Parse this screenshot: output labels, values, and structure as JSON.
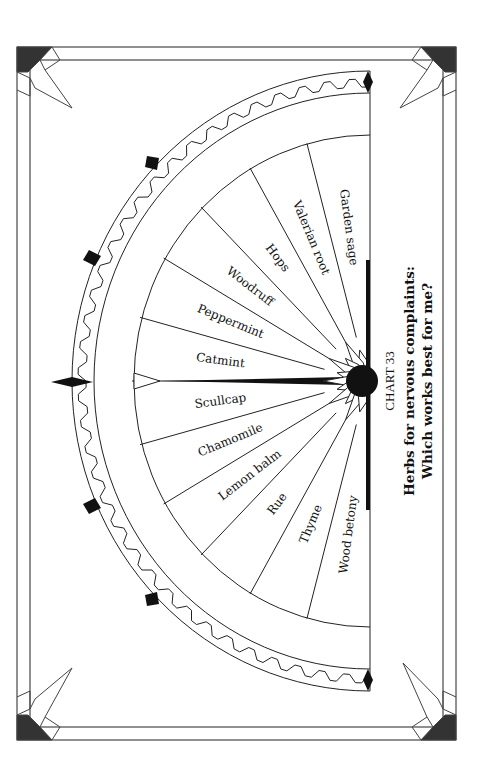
{
  "chart": {
    "number_label": "CHART 33",
    "title_line1": "Herbs for nervous complaints:",
    "title_line2": "Which works best for me?",
    "orientation": "rotated 90 degrees clockwise"
  },
  "chart_data": {
    "type": "pendulum-chart",
    "title": "Herbs for nervous complaints: Which works best for me?",
    "chart_number": "CHART 33",
    "segments": [
      "Wood betony",
      "Thyme",
      "Rue",
      "Lemon balm",
      "Chamomile",
      "Scullcap",
      "Catmint",
      "Peppermint",
      "Woodruff",
      "Hops",
      "Valerian root",
      "Garden sage"
    ],
    "arc_degrees": 180,
    "segment_count": 12
  },
  "wedges": [
    {
      "label": "Garden sage"
    },
    {
      "label": "Valerian root"
    },
    {
      "label": "Hops"
    },
    {
      "label": "Woodruff"
    },
    {
      "label": "Peppermint"
    },
    {
      "label": "Catmint"
    },
    {
      "label": "Scullcap"
    },
    {
      "label": "Chamomile"
    },
    {
      "label": "Lemon balm"
    },
    {
      "label": "Rue"
    },
    {
      "label": "Thyme"
    },
    {
      "label": "Wood betony"
    }
  ],
  "colors": {
    "ink": "#222222",
    "fill_dark": "#333333",
    "paper": "#ffffff"
  }
}
